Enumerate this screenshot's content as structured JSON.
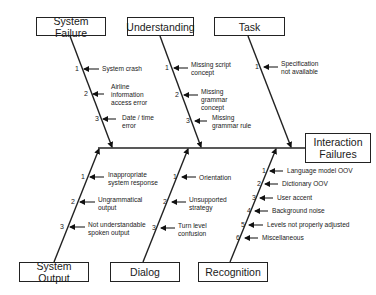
{
  "effect": {
    "label_line1": "Interaction",
    "label_line2": "Failures"
  },
  "categories": {
    "system_failure": {
      "title": "System Failure",
      "causes": [
        {
          "num": "1",
          "text": "System crash"
        },
        {
          "num": "2",
          "text": "Airline information access error"
        },
        {
          "num": "3",
          "text": "Date / time error"
        }
      ]
    },
    "understanding": {
      "title": "Understanding",
      "causes": [
        {
          "num": "1",
          "text": "Missing script concept"
        },
        {
          "num": "2",
          "text": "Missing grammar concept"
        },
        {
          "num": "3",
          "text": "Missing grammar rule"
        }
      ]
    },
    "task": {
      "title": "Task",
      "causes": [
        {
          "num": "1",
          "text": "Specification not available"
        }
      ]
    },
    "system_output": {
      "title": "System Output",
      "causes": [
        {
          "num": "1",
          "text": "Inappropriate system response"
        },
        {
          "num": "2",
          "text": "Ungrammatical output"
        },
        {
          "num": "3",
          "text": "Not understandable spoken output"
        }
      ]
    },
    "dialog": {
      "title": "Dialog",
      "causes": [
        {
          "num": "1",
          "text": "Orientation"
        },
        {
          "num": "2",
          "text": "Unsupported strategy"
        },
        {
          "num": "3",
          "text": "Turn level confusion"
        }
      ]
    },
    "recognition": {
      "title": "Recognition",
      "causes": [
        {
          "num": "1",
          "text": "Language model OOV"
        },
        {
          "num": "2",
          "text": "Dictionary OOV"
        },
        {
          "num": "3",
          "text": "User accent"
        },
        {
          "num": "4",
          "text": "Background noise"
        },
        {
          "num": "5",
          "text": "Levels not properly adjusted"
        },
        {
          "num": "6",
          "text": "Miscellaneous"
        }
      ]
    }
  }
}
